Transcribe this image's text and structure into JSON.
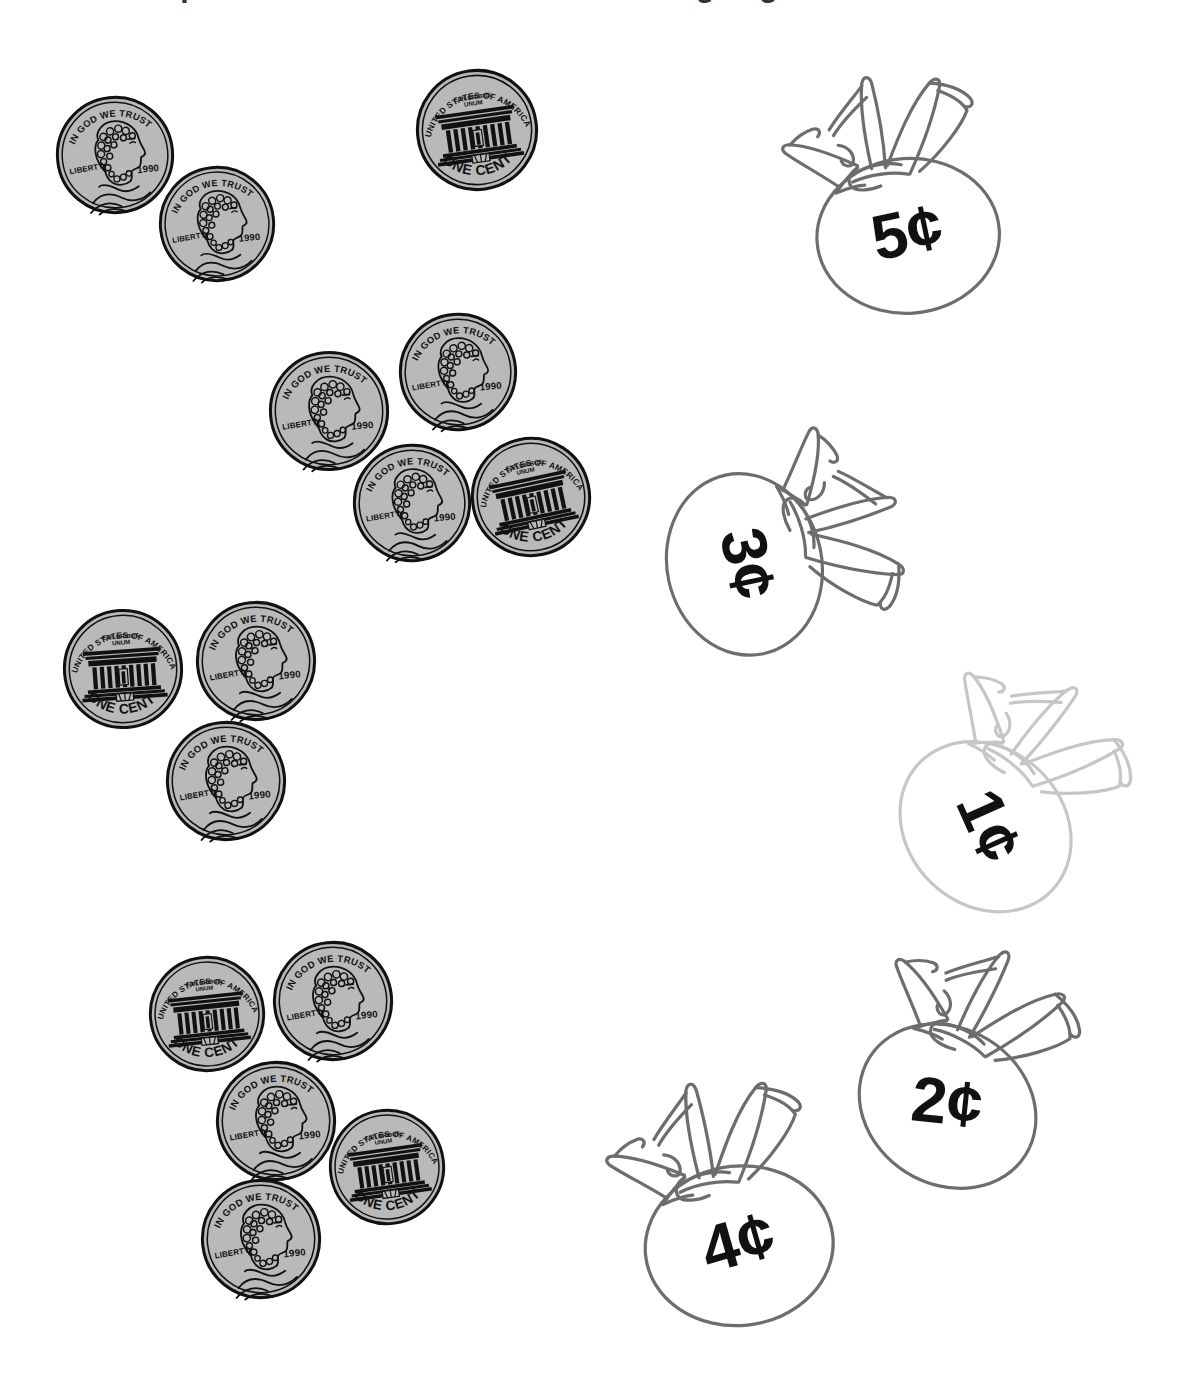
{
  "worksheet": {
    "title": "Count the pennies. Draw a line to the matching bag.",
    "title_visible_fragment": "cut-off descenders of title line",
    "page_background": "#ffffff"
  },
  "coin": {
    "type": "penny",
    "obverse": {
      "motto": "IN GOD WE TRUST",
      "liberty": "LIBERTY",
      "year": "1990"
    },
    "reverse": {
      "country": "UNITED STATES OF AMERICA",
      "motto_line1": "E PLURIBUS",
      "motto_line2": "UNUM",
      "denomination": "ONE CENT"
    },
    "fill_color": "#b9b9b9",
    "edge_color": "#111111"
  },
  "coin_groups": [
    {
      "name": "group-1",
      "count": 3,
      "value_label": "3¢",
      "coins": [
        {
          "side": "obverse",
          "x": 55,
          "y": 95,
          "size": 120,
          "rotate": -6
        },
        {
          "side": "obverse",
          "x": 158,
          "y": 165,
          "size": 118,
          "rotate": -6
        },
        {
          "side": "reverse",
          "x": 415,
          "y": 68,
          "size": 124,
          "rotate": -8
        }
      ]
    },
    {
      "name": "group-2",
      "count": 4,
      "value_label": "4¢",
      "coins": [
        {
          "side": "obverse",
          "x": 268,
          "y": 350,
          "size": 122,
          "rotate": -5
        },
        {
          "side": "obverse",
          "x": 398,
          "y": 312,
          "size": 120,
          "rotate": -5
        },
        {
          "side": "obverse",
          "x": 352,
          "y": 443,
          "size": 120,
          "rotate": -5
        },
        {
          "side": "reverse",
          "x": 470,
          "y": 436,
          "size": 122,
          "rotate": -12
        }
      ]
    },
    {
      "name": "group-3",
      "count": 3,
      "value_label": "3¢",
      "coins": [
        {
          "side": "reverse",
          "x": 62,
          "y": 608,
          "size": 122,
          "rotate": -4
        },
        {
          "side": "obverse",
          "x": 195,
          "y": 600,
          "size": 122,
          "rotate": -6
        },
        {
          "side": "obverse",
          "x": 165,
          "y": 720,
          "size": 122,
          "rotate": -6
        }
      ]
    },
    {
      "name": "group-4",
      "count": 5,
      "value_label": "5¢",
      "coins": [
        {
          "side": "reverse",
          "x": 148,
          "y": 955,
          "size": 118,
          "rotate": -6
        },
        {
          "side": "obverse",
          "x": 272,
          "y": 940,
          "size": 122,
          "rotate": -6
        },
        {
          "side": "obverse",
          "x": 215,
          "y": 1060,
          "size": 122,
          "rotate": -6
        },
        {
          "side": "reverse",
          "x": 328,
          "y": 1108,
          "size": 118,
          "rotate": -8
        },
        {
          "side": "obverse",
          "x": 200,
          "y": 1178,
          "size": 122,
          "rotate": -6
        }
      ]
    }
  ],
  "bags": [
    {
      "name": "bag-5c",
      "label": "5¢",
      "x": 770,
      "y": 60,
      "w": 250,
      "h": 260,
      "rotate": -4,
      "label_rotate": -12,
      "outline_color": "#6d6d6d",
      "faded": false
    },
    {
      "name": "bag-3c",
      "label": "3¢",
      "x": 663,
      "y": 415,
      "w": 250,
      "h": 260,
      "rotate": 78,
      "label_rotate": 78,
      "outline_color": "#6d6d6d",
      "faded": false
    },
    {
      "name": "bag-1c",
      "label": "1¢",
      "x": 885,
      "y": 655,
      "w": 252,
      "h": 262,
      "rotate": 44,
      "label_rotate": 66,
      "outline_color": "#c6c6c6",
      "faded": true
    },
    {
      "name": "bag-2c",
      "label": "2¢",
      "x": 838,
      "y": 930,
      "w": 252,
      "h": 262,
      "rotate": 32,
      "label_rotate": 6,
      "outline_color": "#6d6d6d",
      "faded": false
    },
    {
      "name": "bag-4c",
      "label": "4¢",
      "x": 598,
      "y": 1065,
      "w": 252,
      "h": 268,
      "rotate": -6,
      "label_rotate": -16,
      "outline_color": "#6d6d6d",
      "faded": false
    }
  ],
  "colors": {
    "coin_fill": "#b9b9b9",
    "coin_line": "#111111",
    "bag_line": "#6d6d6d",
    "bag_line_faded": "#c6c6c6",
    "label_text": "#111111",
    "background": "#ffffff"
  }
}
